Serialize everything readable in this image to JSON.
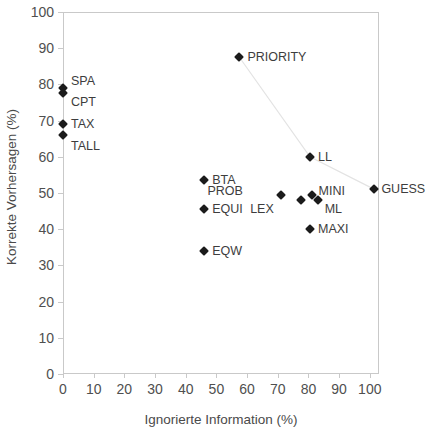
{
  "chart_data": {
    "type": "scatter",
    "title": "",
    "xlabel": "Ignorierte Information (%)",
    "ylabel": "Korrekte Vorhersagen (%)",
    "xlim": [
      0,
      103
    ],
    "ylim": [
      0,
      100
    ],
    "xticks": [
      0,
      10,
      20,
      30,
      40,
      50,
      60,
      70,
      80,
      90,
      100
    ],
    "yticks": [
      0,
      10,
      20,
      30,
      40,
      50,
      60,
      70,
      80,
      90,
      100
    ],
    "grid": false,
    "legend": "none",
    "marker": "diamond",
    "marker_color": "#1b1b1b",
    "line_color": "#e3e3e3",
    "connector_note": "faint polyline connecting PRIORITY, LL and GUESS",
    "connector_points": [
      {
        "label": "PRIORITY",
        "x": 57.5,
        "y": 87.5
      },
      {
        "label": "LL",
        "x": 80.5,
        "y": 60.0
      },
      {
        "label": "GUESS",
        "x": 101.5,
        "y": 51.0
      }
    ],
    "points": [
      {
        "label": "SPA",
        "x": 0.0,
        "y": 79.0,
        "label_dx": 8,
        "label_dy": -7
      },
      {
        "label": "CPT",
        "x": 0.0,
        "y": 77.5,
        "label_dx": 8,
        "label_dy": 9
      },
      {
        "label": "TAX",
        "x": 0.0,
        "y": 69.0,
        "label_dx": 8,
        "label_dy": 0
      },
      {
        "label": "TALL",
        "x": 0.0,
        "y": 66.0,
        "label_dx": 8,
        "label_dy": 11
      },
      {
        "label": "PRIORITY",
        "x": 57.5,
        "y": 87.5,
        "label_dx": 8,
        "label_dy": 0
      },
      {
        "label": "LL",
        "x": 80.5,
        "y": 60.0,
        "label_dx": 8,
        "label_dy": 0
      },
      {
        "label": "GUESS",
        "x": 101.5,
        "y": 51.0,
        "label_dx": 7,
        "label_dy": 0
      },
      {
        "label": "BTA",
        "x": 46.0,
        "y": 53.5,
        "label_dx": 8,
        "label_dy": 0
      },
      {
        "label": "PROB",
        "x": 71.0,
        "y": 49.5,
        "label_dx": -38,
        "label_dy": -4
      },
      {
        "label": "MINI",
        "x": 81.0,
        "y": 49.5,
        "label_dx": 7,
        "label_dy": -4
      },
      {
        "label": "ML",
        "x": 83.0,
        "y": 48.0,
        "label_dx": 7,
        "label_dy": 9
      },
      {
        "label": "LEX",
        "x": 77.5,
        "y": 48.0,
        "label_dx": -27,
        "label_dy": 9
      },
      {
        "label": "EQUI",
        "x": 46.0,
        "y": 45.5,
        "label_dx": 8,
        "label_dy": 0
      },
      {
        "label": "MAXI",
        "x": 80.5,
        "y": 40.0,
        "label_dx": 8,
        "label_dy": 0
      },
      {
        "label": "EQW",
        "x": 46.0,
        "y": 34.0,
        "label_dx": 8,
        "label_dy": 0
      }
    ]
  }
}
